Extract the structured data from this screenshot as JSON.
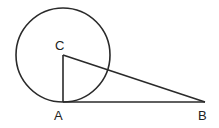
{
  "diagram": {
    "colors": {
      "stroke": "#2a2a2a",
      "background": "#ffffff"
    },
    "circle": {
      "center": "C",
      "cx": 63,
      "cy": 55,
      "r": 47
    },
    "points": {
      "C": {
        "label": "C",
        "x": 63,
        "y": 55
      },
      "A": {
        "label": "A",
        "x": 63,
        "y": 102
      },
      "B": {
        "label": "B",
        "x": 205,
        "y": 102
      }
    },
    "segments": [
      {
        "from": "C",
        "to": "A"
      },
      {
        "from": "A",
        "to": "B"
      },
      {
        "from": "C",
        "to": "B"
      }
    ]
  }
}
